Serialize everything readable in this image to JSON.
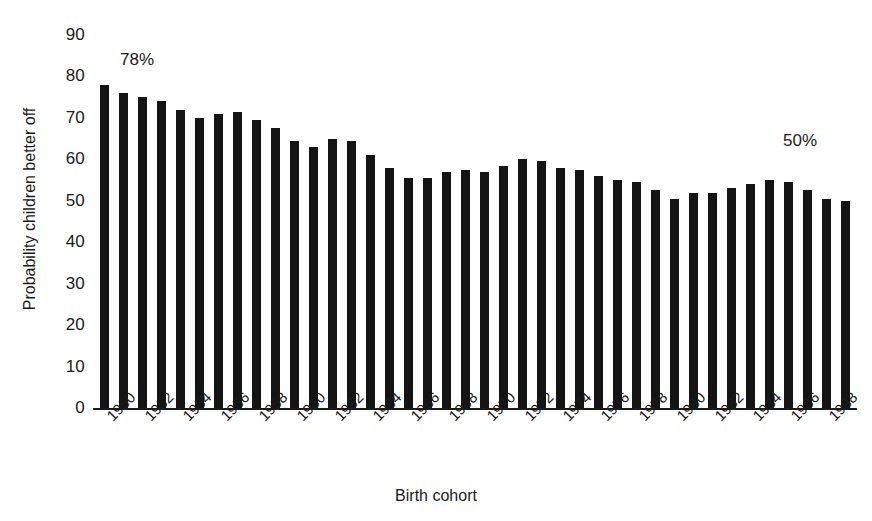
{
  "chart_data": {
    "type": "bar",
    "title": "",
    "xlabel": "Birth cohort",
    "ylabel": "Probability children better off",
    "ylim": [
      0,
      90
    ],
    "ytick_values": [
      0,
      10,
      20,
      30,
      40,
      50,
      60,
      70,
      80,
      90
    ],
    "ytick_labels": [
      "0",
      "10",
      "20",
      "30",
      "40",
      "50",
      "60",
      "70",
      "80",
      "90"
    ],
    "grid": false,
    "legend": "none",
    "bar_color": "#141414",
    "xtick_labels": [
      "1950",
      "1952",
      "1954",
      "1956",
      "1958",
      "1960",
      "1962",
      "1964",
      "1966",
      "1968",
      "1970",
      "1972",
      "1974",
      "1976",
      "1978",
      "1980",
      "1982",
      "1984",
      "1986",
      "1988"
    ],
    "xtick_label_rotation": -45,
    "categories": [
      "1950",
      "1951",
      "1952",
      "1953",
      "1954",
      "1955",
      "1956",
      "1957",
      "1958",
      "1959",
      "1960",
      "1961",
      "1962",
      "1963",
      "1964",
      "1965",
      "1966",
      "1967",
      "1968",
      "1969",
      "1970",
      "1971",
      "1972",
      "1973",
      "1974",
      "1975",
      "1976",
      "1977",
      "1978",
      "1979",
      "1980",
      "1981",
      "1982",
      "1983",
      "1984",
      "1985",
      "1986",
      "1987",
      "1988",
      "1989"
    ],
    "values": [
      78,
      76,
      75,
      74,
      72,
      70,
      71,
      71.5,
      69.5,
      67.5,
      64.5,
      63,
      65,
      64.5,
      61,
      58,
      55.5,
      55.5,
      57,
      57.5,
      57,
      58.5,
      60,
      59.5,
      58,
      57.5,
      56,
      55,
      54.5,
      52.5,
      50.5,
      52,
      52,
      53,
      54,
      55,
      54.5,
      52.5,
      50.5,
      50
    ],
    "annotations": [
      {
        "text": "78%",
        "target_category": "1950",
        "position": "above-left-end"
      },
      {
        "text": "50%",
        "target_category": "1989",
        "position": "above-right-end"
      }
    ]
  },
  "axis": {
    "y_title": "Probability children better off",
    "x_title": "Birth cohort"
  },
  "annotations": {
    "start_label": "78%",
    "end_label": "50%"
  },
  "page": {
    "top_fragment": ""
  }
}
